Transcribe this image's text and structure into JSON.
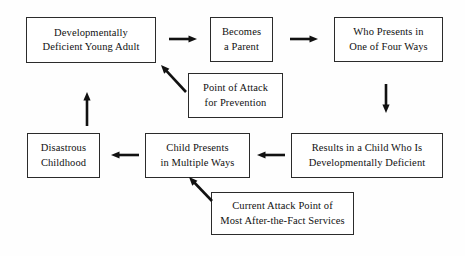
{
  "diagram": {
    "background_color": "#fefefe",
    "ink_color": "#111111",
    "border_color": "#2b2b2b",
    "nodes": [
      {
        "id": "developmentally-deficient-young-adult",
        "label": "Developmentally\nDeficient Young Adult",
        "x": 26,
        "y": 17,
        "w": 130,
        "h": 46
      },
      {
        "id": "becomes-a-parent",
        "label": "Becomes\na Parent",
        "x": 210,
        "y": 17,
        "w": 63,
        "h": 45
      },
      {
        "id": "who-presents-in-one-of-four-ways",
        "label": "Who Presents in\nOne of Four Ways",
        "x": 334,
        "y": 17,
        "w": 109,
        "h": 45
      },
      {
        "id": "point-of-attack-for-prevention",
        "label": "Point of Attack\nfor Prevention",
        "x": 188,
        "y": 73,
        "w": 95,
        "h": 45
      },
      {
        "id": "results-in-a-child-who-is-developmentally-deficient",
        "label": "Results in a Child Who Is\nDevelopmentally Deficient",
        "x": 291,
        "y": 133,
        "w": 152,
        "h": 45
      },
      {
        "id": "child-presents-in-multiple-ways",
        "label": "Child Presents\nin Multiple Ways",
        "x": 145,
        "y": 133,
        "w": 105,
        "h": 45
      },
      {
        "id": "disastrous-childhood",
        "label": "Disastrous\nChildhood",
        "x": 27,
        "y": 133,
        "w": 73,
        "h": 45
      },
      {
        "id": "current-attack-point-of-most-after-the-fact-services",
        "label": "Current Attack Point of\nMost After-the-Fact Services",
        "x": 211,
        "y": 192,
        "w": 143,
        "h": 43
      }
    ],
    "arrows": [
      {
        "id": "arrow-young-adult-to-becomes-parent",
        "direction": "right",
        "from": "developmentally-deficient-young-adult",
        "to": "becomes-a-parent",
        "x1": 169,
        "y1": 39,
        "x2": 197,
        "y2": 39
      },
      {
        "id": "arrow-becomes-parent-to-who-presents",
        "direction": "right",
        "from": "becomes-a-parent",
        "to": "who-presents-in-one-of-four-ways",
        "x1": 290,
        "y1": 39,
        "x2": 318,
        "y2": 39
      },
      {
        "id": "arrow-who-presents-to-results-in-child",
        "direction": "down",
        "from": "who-presents-in-one-of-four-ways",
        "to": "results-in-a-child-who-is-developmentally-deficient",
        "x1": 386,
        "y1": 84,
        "x2": 386,
        "y2": 113
      },
      {
        "id": "arrow-results-in-child-to-child-presents",
        "direction": "left",
        "from": "results-in-a-child-who-is-developmentally-deficient",
        "to": "child-presents-in-multiple-ways",
        "x1": 285,
        "y1": 155,
        "x2": 257,
        "y2": 155
      },
      {
        "id": "arrow-child-presents-to-disastrous-childhood",
        "direction": "left",
        "from": "child-presents-in-multiple-ways",
        "to": "disastrous-childhood",
        "x1": 139,
        "y1": 155,
        "x2": 111,
        "y2": 155
      },
      {
        "id": "arrow-disastrous-childhood-to-young-adult",
        "direction": "up",
        "from": "disastrous-childhood",
        "to": "developmentally-deficient-young-adult",
        "x1": 87,
        "y1": 126,
        "x2": 87,
        "y2": 92
      },
      {
        "id": "arrow-point-of-attack-to-young-adult",
        "direction": "up-left",
        "from": "point-of-attack-for-prevention",
        "to": "developmentally-deficient-young-adult",
        "x1": 186,
        "y1": 92,
        "x2": 161,
        "y2": 65
      },
      {
        "id": "arrow-current-attack-point-to-child-presents",
        "direction": "up-left",
        "from": "current-attack-point-of-most-after-the-fact-services",
        "to": "child-presents-in-multiple-ways",
        "x1": 212,
        "y1": 201,
        "x2": 189,
        "y2": 177
      }
    ]
  }
}
